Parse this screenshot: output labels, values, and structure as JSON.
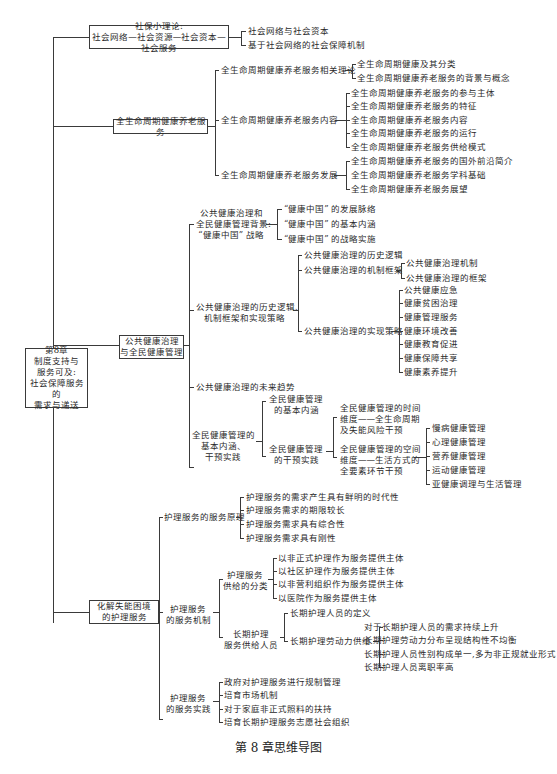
{
  "root": {
    "lines": [
      "第8章",
      "制度支持与",
      "服务可及:",
      "社会保障服务的",
      "需求与递送"
    ]
  },
  "branch1": {
    "lines": [
      "社保小理论:",
      "社会网络—社会资源—社会资本—社会服务"
    ],
    "children": [
      "社会网络与社会资本",
      "基于社会网络的社会保障机制"
    ]
  },
  "branch2": {
    "label": "全生命周期健康养老服务",
    "theory": {
      "label": "全生命周期健康养老服务相关理论",
      "children": [
        "全生命周期健康及其分类",
        "全生命周期健康养老服务的背景与概念"
      ]
    },
    "content": {
      "label": "全生命周期健康养老服务内容",
      "children": [
        "全生命周期健康养老服务的参与主体",
        "全生命周期健康养老服务的特征",
        "全生命周期健康养老服务内容",
        "全生命周期健康养老服务的运行",
        "全生命周期健康养老服务供给模式"
      ]
    },
    "development": {
      "label": "全生命周期健康养老服务发展",
      "children": [
        "全生命周期健康养老服务的国外前沿简介",
        "全生命周期健康养老服务学科基础",
        "全生命周期健康养老服务展望"
      ]
    }
  },
  "branch3": {
    "lines": [
      "公共健康治理",
      "与全民健康管理"
    ],
    "background": {
      "lines": [
        "公共健康治理和",
        "全民健康管理背景:",
        "“健康中国” 战略"
      ],
      "children": [
        "“健康中国” 的发展脉络",
        "“健康中国” 的基本内涵",
        "“健康中国” 的战略实施"
      ]
    },
    "history": {
      "lines": [
        "公共健康治理的历史逻辑、",
        "机制框架和实现策略"
      ],
      "logic": "公共健康治理的历史逻辑",
      "framework": {
        "label": "公共健康治理的机制框架",
        "children": [
          "公共健康治理机制",
          "公共健康治理的框架"
        ]
      },
      "strategy": {
        "label": "公共健康治理的实现策略",
        "children": [
          "公共健康应急",
          "健康贫困治理",
          "健康管理服务",
          "健康环境改善",
          "健康教育促进",
          "健康保障共享",
          "健康素养提升"
        ]
      }
    },
    "trend": "公共健康治理的未来趋势",
    "national": {
      "lines": [
        "全民健康管理的",
        "基本内涵、",
        "干预实践"
      ],
      "connotation": {
        "lines": [
          "全民健康管理",
          "的基本内涵"
        ]
      },
      "practice": {
        "lines": [
          "全民健康管理",
          "的干预实践"
        ],
        "time": {
          "lines": [
            "全民健康管理的时间",
            "维度——全生命周期",
            "及失能风险干预"
          ]
        },
        "space": {
          "lines": [
            "全民健康管理的空间",
            "维度——生活方式的",
            "全要素环节干预"
          ],
          "children": [
            "慢病健康管理",
            "心理健康管理",
            "营养健康管理",
            "运动健康管理",
            "亚健康调理与生活管理"
          ]
        }
      }
    }
  },
  "branch4": {
    "lines": [
      "化解失能困境",
      "的护理服务"
    ],
    "principle": {
      "label": "护理服务的服务原理",
      "children": [
        "护理服务的需求产生具有鲜明的时代性",
        "护理服务需求的期限较长",
        "护理服务需求具有综合性",
        "护理服务需求具有刚性"
      ]
    },
    "mechanism": {
      "lines": [
        "护理服务",
        "的服务机制"
      ],
      "classification": {
        "lines": [
          "护理服务",
          "供给的分类"
        ],
        "children": [
          "以非正式护理作为服务提供主体",
          "以社区护理作为服务提供主体",
          "以非营利组织作为服务提供主体",
          "以医院作为服务提供主体"
        ]
      },
      "personnel": {
        "lines": [
          "长期护理",
          "服务供给人员"
        ],
        "definition": "长期护理人员的定义",
        "labor": {
          "label": "长期护理劳动力供给",
          "children": [
            "对于长期护理人员的需求持续上升",
            "长期护理劳动力分布呈现结构性不均衡",
            "长期护理人员性别构成单一,多为非正规就业形式",
            "长期护理人员离职率高"
          ]
        }
      }
    },
    "practice": {
      "lines": [
        "护理服务",
        "的服务实践"
      ],
      "children": [
        "政府对护理服务进行规制管理",
        "培育市场机制",
        "对于家庭非正式照料的扶持",
        "培育长期护理服务志愿社会组织"
      ]
    }
  },
  "caption": "第 8 章思维导图"
}
